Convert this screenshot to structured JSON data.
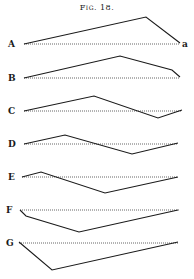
{
  "figure": {
    "title": "Fig. 18.",
    "end_label": "a",
    "rows": [
      {
        "label": "A",
        "baseline_y": 44,
        "baseline": [
          24,
          180
        ],
        "points": [
          [
            24,
            44
          ],
          [
            146,
            17
          ],
          [
            180,
            43
          ]
        ]
      },
      {
        "label": "B",
        "baseline_y": 78,
        "baseline": [
          24,
          180
        ],
        "points": [
          [
            24,
            78
          ],
          [
            120,
            56
          ],
          [
            172,
            70
          ],
          [
            180,
            77
          ]
        ]
      },
      {
        "label": "C",
        "baseline_y": 111,
        "baseline": [
          24,
          182
        ],
        "points": [
          [
            24,
            111
          ],
          [
            94,
            96
          ],
          [
            158,
            118
          ],
          [
            182,
            110
          ]
        ]
      },
      {
        "label": "D",
        "baseline_y": 144,
        "baseline": [
          24,
          178
        ],
        "points": [
          [
            24,
            144
          ],
          [
            65,
            135
          ],
          [
            132,
            154
          ],
          [
            178,
            143
          ]
        ]
      },
      {
        "label": "E",
        "baseline_y": 177,
        "baseline": [
          22,
          178
        ],
        "points": [
          [
            22,
            177
          ],
          [
            41,
            172
          ],
          [
            105,
            193
          ],
          [
            178,
            177
          ]
        ]
      },
      {
        "label": "F",
        "baseline_y": 210,
        "baseline": [
          20,
          180
        ],
        "points": [
          [
            20,
            210
          ],
          [
            26,
            216
          ],
          [
            79,
            232
          ],
          [
            178,
            210
          ]
        ]
      },
      {
        "label": "G",
        "baseline_y": 243,
        "baseline": [
          19,
          178
        ],
        "points": [
          [
            19,
            242
          ],
          [
            52,
            270
          ],
          [
            178,
            242
          ]
        ]
      }
    ]
  }
}
